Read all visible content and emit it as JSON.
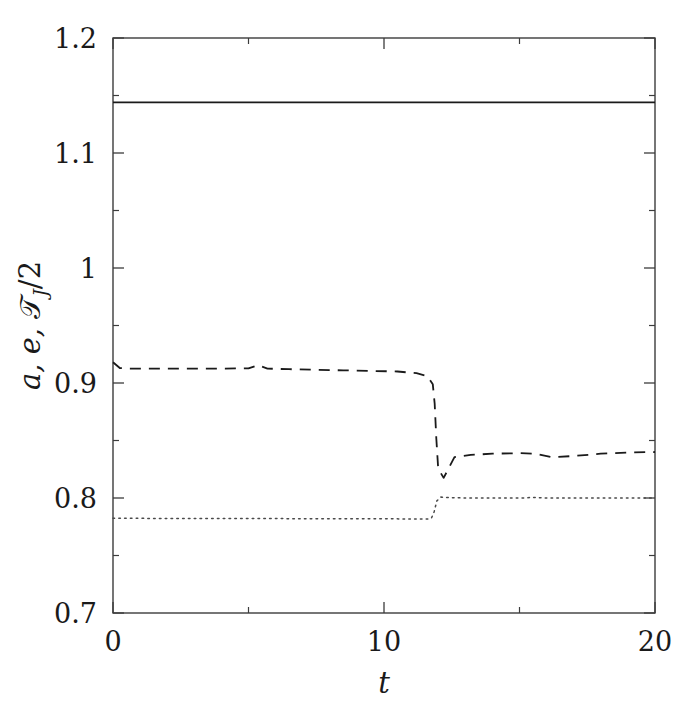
{
  "figure": {
    "background_color": "#ffffff",
    "frame_color": "#3c3c3c",
    "width": 686,
    "height": 714
  },
  "chart_data": {
    "type": "line",
    "title": "",
    "xlabel": "t",
    "ylabel": "a, e, T_J/2",
    "ylabel_parts": {
      "a": "a",
      "comma1": ",",
      "e": "e",
      "comma2": ",",
      "script_t": "𝒯",
      "subscript_j": "J",
      "divide_two": "/2"
    },
    "xlim": [
      0,
      20
    ],
    "ylim": [
      0.7,
      1.2
    ],
    "xticks": [
      0,
      10,
      20
    ],
    "xtick_labels": [
      "0",
      "10",
      "20"
    ],
    "xticks_minor": [
      5,
      15
    ],
    "yticks": [
      0.7,
      0.8,
      0.9,
      1.0,
      1.1,
      1.2
    ],
    "ytick_labels": [
      "0.7",
      "0.8",
      "0.9",
      "1",
      "1.1",
      "1.2"
    ],
    "yticks_minor": [
      0.75,
      0.85,
      0.95,
      1.05,
      1.15
    ],
    "grid": false,
    "legend": null,
    "tick_direction": "in",
    "series": [
      {
        "name": "T_J/2",
        "style": "solid",
        "color": "#1a1a1a",
        "linewidth": 1.6,
        "description": "Constant Tisserand parameter, flat across full range",
        "x": [
          0,
          2,
          4,
          6,
          8,
          10,
          12,
          14,
          16,
          18,
          20
        ],
        "values": [
          1.144,
          1.144,
          1.144,
          1.144,
          1.144,
          1.144,
          1.144,
          1.144,
          1.144,
          1.144,
          1.144
        ]
      },
      {
        "name": "a",
        "style": "dashed",
        "color": "#1a1a1a",
        "linewidth": 1.8,
        "description": "Semi-major axis: near 0.915 until t=11.9, then sharp drop to 0.816 and recovery to 0.840",
        "x": [
          0.0,
          0.25,
          0.6,
          1.2,
          2.0,
          3.0,
          4.0,
          5.0,
          5.35,
          5.7,
          6.5,
          7.5,
          8.5,
          9.5,
          10.5,
          11.2,
          11.6,
          11.8,
          11.87,
          11.93,
          12.0,
          12.2,
          12.6,
          13.2,
          14.0,
          15.0,
          15.6,
          16.2,
          17.0,
          18.0,
          19.0,
          20.0
        ],
        "values": [
          0.918,
          0.913,
          0.9125,
          0.9125,
          0.9125,
          0.9125,
          0.9125,
          0.9128,
          0.9155,
          0.9125,
          0.912,
          0.9115,
          0.911,
          0.9105,
          0.91,
          0.9085,
          0.906,
          0.899,
          0.882,
          0.852,
          0.8255,
          0.8175,
          0.8355,
          0.8375,
          0.8385,
          0.839,
          0.8385,
          0.8355,
          0.8365,
          0.8385,
          0.8395,
          0.84
        ]
      },
      {
        "name": "e",
        "style": "dotted",
        "color": "#4a4a4a",
        "linewidth": 1.5,
        "description": "Eccentricity: near 0.782 until t=11.9, then step up to 0.800",
        "x": [
          0.0,
          1.0,
          2.0,
          3.0,
          4.0,
          5.0,
          6.0,
          7.0,
          8.0,
          9.0,
          10.0,
          11.0,
          11.6,
          11.75,
          11.85,
          11.95,
          12.1,
          12.5,
          13.0,
          14.0,
          15.0,
          15.5,
          16.0,
          17.0,
          18.0,
          19.0,
          20.0
        ],
        "values": [
          0.7825,
          0.7823,
          0.7822,
          0.7822,
          0.7822,
          0.7822,
          0.7821,
          0.782,
          0.782,
          0.782,
          0.7819,
          0.7818,
          0.7817,
          0.7825,
          0.788,
          0.7975,
          0.8008,
          0.8003,
          0.8,
          0.7999,
          0.7999,
          0.8005,
          0.8,
          0.7999,
          0.7999,
          0.8,
          0.8
        ]
      }
    ]
  }
}
